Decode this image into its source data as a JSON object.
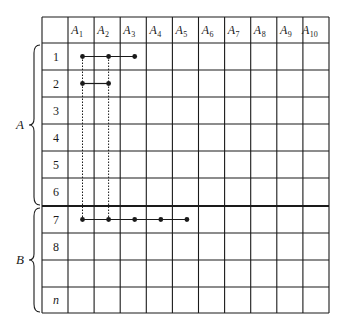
{
  "table": {
    "left": 42,
    "right": 329,
    "top": 17,
    "first_col_width": 26,
    "col_width": 26.1,
    "header_height": 26,
    "row_y": [
      43,
      70,
      97,
      124,
      151,
      178,
      206,
      233,
      260,
      287,
      313
    ],
    "thick_line_after_row_index": 6,
    "columns": [
      {
        "base": "A",
        "sub": "1"
      },
      {
        "base": "A",
        "sub": "2"
      },
      {
        "base": "A",
        "sub": "3"
      },
      {
        "base": "A",
        "sub": "4"
      },
      {
        "base": "A",
        "sub": "5"
      },
      {
        "base": "A",
        "sub": "6"
      },
      {
        "base": "A",
        "sub": "7"
      },
      {
        "base": "A",
        "sub": "8"
      },
      {
        "base": "A",
        "sub": "9"
      },
      {
        "base": "A",
        "sub": "10"
      }
    ],
    "rows": [
      {
        "label": "1",
        "italic": false
      },
      {
        "label": "2",
        "italic": false
      },
      {
        "label": "3",
        "italic": false
      },
      {
        "label": "4",
        "italic": false
      },
      {
        "label": "5",
        "italic": false
      },
      {
        "label": "6",
        "italic": false
      },
      {
        "label": "7",
        "italic": false
      },
      {
        "label": "8",
        "italic": false
      },
      {
        "label": "",
        "italic": false
      },
      {
        "label": "n",
        "italic": true
      }
    ]
  },
  "groups": [
    {
      "label": "A",
      "rows_from": 0,
      "rows_to": 5
    },
    {
      "label": "B",
      "rows_from": 6,
      "rows_to": 9
    }
  ],
  "connections": [
    {
      "row": 0,
      "cols": [
        0,
        1,
        2
      ]
    },
    {
      "row": 1,
      "cols": [
        0,
        1
      ]
    },
    {
      "row": 6,
      "cols": [
        0,
        1,
        2,
        3,
        4
      ]
    }
  ],
  "dotted_links": [
    {
      "col": 0,
      "from_row": 0,
      "to_row": 6
    },
    {
      "col": 1,
      "from_row": 0,
      "to_row": 6
    }
  ],
  "colors": {
    "line": "#1a1a1a",
    "background": "#ffffff"
  }
}
